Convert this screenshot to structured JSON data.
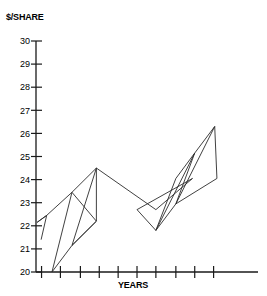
{
  "chart_data": {
    "type": "line",
    "title": "",
    "xlabel": "YEARS",
    "ylabel": "$/SHARE",
    "ylim": [
      20,
      30
    ],
    "xlim": [
      0,
      10
    ],
    "grid": false,
    "legend": null,
    "ytick_labels": [
      "30",
      "29",
      "28",
      "27",
      "26",
      "25",
      "24",
      "23",
      "22",
      "21",
      "20"
    ],
    "ytick_values": [
      30,
      29,
      28,
      27,
      26,
      25,
      24,
      23,
      22,
      21,
      20
    ],
    "xtick_labels": [
      "",
      "",
      "",
      "",
      "",
      "",
      "",
      "",
      "",
      ""
    ],
    "xtick_values": [
      0.25,
      1.1,
      2.0,
      2.85,
      3.7,
      4.55,
      5.4,
      6.3,
      7.15,
      8.0
    ],
    "series": [
      {
        "name": "share-price",
        "points": [
          [
            0.23,
            21.4
          ],
          [
            0.48,
            22.45
          ],
          [
            0.05,
            22.15
          ],
          [
            0.48,
            22.45
          ],
          [
            1.62,
            23.45
          ],
          [
            0.72,
            20.0
          ],
          [
            1.62,
            21.15
          ],
          [
            2.72,
            22.2
          ],
          [
            1.62,
            23.45
          ],
          [
            2.72,
            24.5
          ],
          [
            1.62,
            21.15
          ],
          [
            2.72,
            22.2
          ],
          [
            2.72,
            24.5
          ],
          [
            5.4,
            22.7
          ],
          [
            7.05,
            24.05
          ],
          [
            4.55,
            22.7
          ],
          [
            5.4,
            21.8
          ],
          [
            6.3,
            24.05
          ],
          [
            7.15,
            25.15
          ],
          [
            5.4,
            21.8
          ],
          [
            6.3,
            22.95
          ],
          [
            7.15,
            25.15
          ],
          [
            8.05,
            26.3
          ],
          [
            6.3,
            22.95
          ],
          [
            8.15,
            24.05
          ],
          [
            8.05,
            26.3
          ]
        ]
      }
    ],
    "annotations": []
  },
  "axes": {
    "y_axis_title": "$/SHARE",
    "x_axis_title": "YEARS"
  }
}
